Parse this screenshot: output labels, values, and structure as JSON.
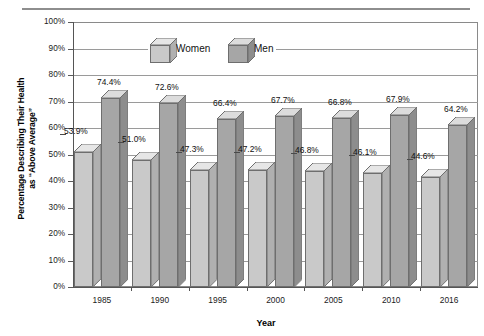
{
  "chart_data": {
    "type": "bar",
    "title": "",
    "xlabel": "Year",
    "ylabel": "Percentage Describing Their Health as “Above Average”",
    "ylabel_line1": "Percentage Describing Their Health",
    "ylabel_line2": "as “Above Average”",
    "categories": [
      "1985",
      "1990",
      "1995",
      "2000",
      "2005",
      "2010",
      "2016"
    ],
    "series": [
      {
        "name": "Women",
        "values": [
          53.9,
          51.0,
          47.3,
          47.2,
          46.8,
          46.1,
          44.6
        ],
        "labels": [
          "53.9%",
          "51.0%",
          "47.3%",
          "47.2%",
          "46.8%",
          "46.1%",
          "44.6%"
        ],
        "color": "#c9c9c9",
        "top_color": "#e6e6e6",
        "side_color": "#b0b0b0"
      },
      {
        "name": "Men",
        "values": [
          74.4,
          72.6,
          66.4,
          67.7,
          66.8,
          67.9,
          64.2
        ],
        "labels": [
          "74.4%",
          "72.6%",
          "66.4%",
          "67.7%",
          "66.8%",
          "67.9%",
          "64.2%"
        ],
        "color": "#a6a6a6",
        "top_color": "#dcdcdc",
        "side_color": "#8d8d8d"
      }
    ],
    "ylim": [
      0,
      100
    ],
    "ytick_values": [
      100,
      90,
      80,
      70,
      60,
      50,
      40,
      30,
      20,
      10,
      0
    ],
    "ytick_labels": [
      "100%",
      "90%",
      "80%",
      "70%",
      "60%",
      "50%",
      "40%",
      "30%",
      "20%",
      "10%",
      "0%"
    ],
    "grid": true,
    "legend_position": "top-center",
    "legend": [
      "Women",
      "Men"
    ]
  },
  "axis": {
    "x_title": "Year"
  }
}
